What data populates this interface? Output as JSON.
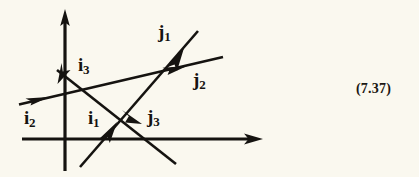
{
  "figure": {
    "name": "vector-diagram",
    "background_color": "#faf8ef",
    "ink_color": "#151310",
    "equation_number": "(7.37)",
    "axes": {
      "vertical_axis_name": "vertical-axis",
      "horizontal_axis_name": "horizontal-axis"
    },
    "labels": [
      {
        "id": "i1",
        "base": "i",
        "sub": "1",
        "x": 88,
        "y": 108
      },
      {
        "id": "i2",
        "base": "i",
        "sub": "2",
        "x": 24,
        "y": 108
      },
      {
        "id": "i3",
        "base": "i",
        "sub": "3",
        "x": 78,
        "y": 55
      },
      {
        "id": "j1",
        "base": "j",
        "sub": "1",
        "x": 158,
        "y": 22
      },
      {
        "id": "j2",
        "base": "j",
        "sub": "2",
        "x": 193,
        "y": 70
      },
      {
        "id": "j3",
        "base": "j",
        "sub": "3",
        "x": 147,
        "y": 107
      }
    ],
    "vectors": [
      {
        "id": "line-i2-j2",
        "label_head": "j2",
        "label_tail": "i2"
      },
      {
        "id": "line-i3-j3",
        "label_head": "j3",
        "label_tail": "i3"
      },
      {
        "id": "line-i1-j1",
        "label_head": "j1",
        "label_tail": "i1"
      }
    ]
  }
}
